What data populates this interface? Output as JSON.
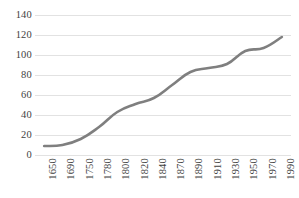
{
  "chart_data": {
    "type": "line",
    "title": "",
    "subtitle": "",
    "xlabel": "",
    "ylabel": "",
    "x": [
      1650,
      1690,
      1750,
      1780,
      1800,
      1820,
      1840,
      1870,
      1890,
      1910,
      1930,
      1950,
      1970,
      1990
    ],
    "categories": [
      "1650",
      "1690",
      "1750",
      "1780",
      "1800",
      "1820",
      "1840",
      "1870",
      "1890",
      "1910",
      "1930",
      "1950",
      "1970",
      "1990"
    ],
    "values": [
      9,
      10,
      16,
      28,
      43,
      51,
      57,
      70,
      83,
      87,
      91,
      104,
      107,
      118
    ],
    "series": [
      {
        "name": "",
        "values": [
          9,
          10,
          16,
          28,
          43,
          51,
          57,
          70,
          83,
          87,
          91,
          104,
          107,
          118
        ],
        "color": "#7f7f7f"
      }
    ],
    "ylim": [
      0,
      140
    ],
    "yticks": [
      0,
      20,
      40,
      60,
      80,
      100,
      120,
      140
    ],
    "ytick_labels": [
      "0",
      "20",
      "40",
      "60",
      "80",
      "100",
      "120",
      "140"
    ],
    "xlim": [
      1650,
      2000
    ],
    "grid": true,
    "grid_axis": "y",
    "grid_color": "#e2e2e2",
    "legend": false,
    "legend_position": "none",
    "line_width": 2.6,
    "markers": false,
    "background": "#ffffff",
    "label_color": "#3f3f3f",
    "xtick_rotation": -90
  }
}
